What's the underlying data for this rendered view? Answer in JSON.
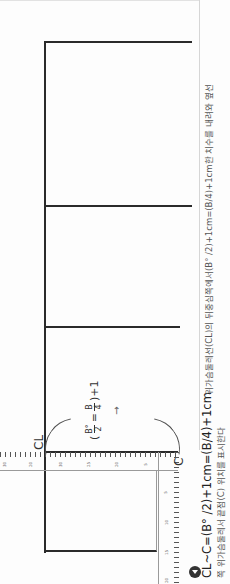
{
  "diagram": {
    "labels": {
      "cl": "CL",
      "c": "C"
    },
    "formula": {
      "open": "(",
      "num1": "B°",
      "den1": "2",
      "equals": "=",
      "num2": "B",
      "den2": "4",
      "close": ")+1"
    },
    "arrow": "→",
    "ruler_ticks": {
      "horizontal": [
        "30",
        "20",
        "30",
        "25",
        "20",
        "5"
      ],
      "vertical": [
        "5",
        "10",
        "15",
        "20"
      ]
    }
  },
  "caption": {
    "formula": "CL~C=(B° /2)+1cm=(B/4)+1cm",
    "text_line1": "위가슴둘레선(CL)의 뒤중심쪽에서(B° /2)+1cm=(B/4)+1cm한 치수를 내려와 옆선",
    "text_line2": "쪽 위가슴둘레서 끝점(C) 위치를 표시한다"
  },
  "colors": {
    "line": "#2a2a2a",
    "ruler": "#555555",
    "text": "#222222",
    "muted_text": "#555555"
  }
}
